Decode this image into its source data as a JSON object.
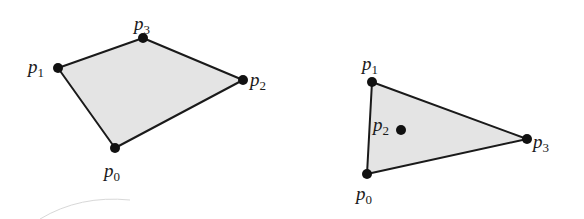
{
  "diagram": {
    "background": "#ffffff",
    "fill_color": "#e4e4e4",
    "stroke_color": "#1a1a1a",
    "point_color": "#111111",
    "figures": [
      {
        "name": "convex-quadrilateral",
        "polygon_order": [
          "p1",
          "p3",
          "p2",
          "p0"
        ],
        "points": {
          "p0": {
            "label": "p",
            "sub": "0",
            "x": 115,
            "y": 148,
            "lx": 104,
            "ly": 177
          },
          "p1": {
            "label": "p",
            "sub": "1",
            "x": 58,
            "y": 68,
            "lx": 28,
            "ly": 73
          },
          "p2": {
            "label": "p",
            "sub": "2",
            "x": 243,
            "y": 80,
            "lx": 250,
            "ly": 86
          },
          "p3": {
            "label": "p",
            "sub": "3",
            "x": 143,
            "y": 38,
            "lx": 134,
            "ly": 30
          }
        }
      },
      {
        "name": "triangle-with-interior-point",
        "polygon_order": [
          "p1",
          "p3",
          "p0"
        ],
        "points": {
          "p0": {
            "label": "p",
            "sub": "0",
            "x": 367,
            "y": 174,
            "lx": 356,
            "ly": 200
          },
          "p1": {
            "label": "p",
            "sub": "1",
            "x": 372,
            "y": 82,
            "lx": 362,
            "ly": 70
          },
          "p2": {
            "label": "p",
            "sub": "2",
            "x": 401,
            "y": 130,
            "lx": 373,
            "ly": 131
          },
          "p3": {
            "label": "p",
            "sub": "3",
            "x": 527,
            "y": 139,
            "lx": 533,
            "ly": 148
          }
        }
      }
    ]
  }
}
